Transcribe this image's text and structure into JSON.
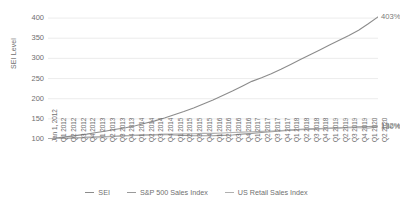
{
  "chart_data": {
    "type": "line",
    "title": "",
    "xlabel": "",
    "ylabel": "SEI Level",
    "ylim": [
      100,
      425
    ],
    "yticks": [
      100,
      150,
      200,
      250,
      300,
      350,
      400
    ],
    "grid": true,
    "legend_position": "bottom",
    "categories": [
      "Jan 1, 2012",
      "Q1 2012",
      "Q2 2012",
      "Q3 2012",
      "Q4 2012",
      "Q1 2013",
      "Q2 2013",
      "Q3 2013",
      "Q4 2013",
      "Q1 2014",
      "Q2 2014",
      "Q3 2014",
      "Q4 2014",
      "Q1 2015",
      "Q2 2015",
      "Q3 2015",
      "Q4 2015",
      "Q1 2016",
      "Q2 2016",
      "Q3 2016",
      "Q4 2016",
      "Q1 2017",
      "Q2 2017",
      "Q3 2017",
      "Q4 2017",
      "Q1 2018",
      "Q2 2018",
      "Q3 2018",
      "Q4 2018",
      "Q1 2019",
      "Q2 2019",
      "Q3 2019",
      "Q4 2019",
      "Q1 2020",
      "Q2 2020"
    ],
    "series": [
      {
        "name": "SEI",
        "color": "#8c8c8c",
        "end_label": "403%",
        "values": [
          100,
          103,
          106,
          109,
          112,
          116,
          120,
          124,
          128,
          133,
          139,
          145,
          152,
          160,
          168,
          177,
          187,
          197,
          208,
          219,
          231,
          243,
          252,
          262,
          273,
          285,
          297,
          309,
          321,
          333,
          345,
          357,
          370,
          386,
          403
        ]
      },
      {
        "name": "S&P 500 Sales Index",
        "color": "#9a9a9a",
        "end_label": "132%",
        "values": [
          100,
          101,
          102,
          103,
          104,
          105,
          106,
          107,
          108,
          109,
          110,
          110,
          111,
          110,
          109,
          108,
          108,
          108,
          109,
          110,
          112,
          114,
          116,
          118,
          120,
          122,
          124,
          125,
          126,
          127,
          128,
          129,
          130,
          131,
          132
        ]
      },
      {
        "name": "US Retail Sales Index",
        "color": "#b0b0b0",
        "end_label": "130%",
        "values": [
          100,
          101,
          102,
          103,
          104,
          105,
          106,
          107,
          108,
          109,
          110,
          111,
          112,
          112,
          113,
          113,
          114,
          114,
          115,
          116,
          117,
          118,
          119,
          120,
          121,
          122,
          123,
          124,
          125,
          126,
          127,
          128,
          128,
          127,
          130
        ]
      }
    ]
  },
  "legend": {
    "items": [
      {
        "label": "SEI"
      },
      {
        "label": "S&P 500 Sales Index"
      },
      {
        "label": "US Retail Sales Index"
      }
    ]
  }
}
